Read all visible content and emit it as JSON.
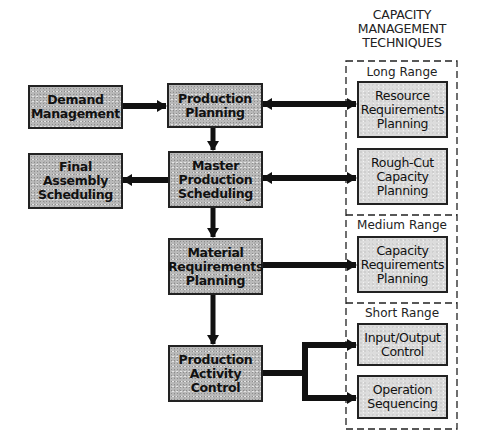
{
  "diagram": {
    "type": "flowchart",
    "header": {
      "title": "CAPACITY\nMANAGEMENT\nTECHNIQUES"
    },
    "planning_boxes": [
      {
        "id": "demand_management",
        "label": "Demand\nManagement"
      },
      {
        "id": "production_planning",
        "label": "Production\nPlanning"
      },
      {
        "id": "final_assembly_scheduling",
        "label": "Final\nAssembly\nScheduling"
      },
      {
        "id": "master_production_scheduling",
        "label": "Master\nProduction\nScheduling"
      },
      {
        "id": "material_requirements_planning",
        "label": "Material\nRequirements\nPlanning"
      },
      {
        "id": "production_activity_control",
        "label": "Production\nActivity\nControl"
      }
    ],
    "capacity_sections": [
      {
        "label": "Long Range",
        "boxes": [
          {
            "id": "resource_requirements_planning",
            "label": "Resource\nRequirements\nPlanning"
          },
          {
            "id": "rough_cut_capacity_planning",
            "label": "Rough-Cut\nCapacity\nPlanning"
          }
        ]
      },
      {
        "label": "Medium Range",
        "boxes": [
          {
            "id": "capacity_requirements_planning",
            "label": "Capacity\nRequirements\nPlanning"
          }
        ]
      },
      {
        "label": "Short Range",
        "boxes": [
          {
            "id": "input_output_control",
            "label": "Input/Output\nControl"
          },
          {
            "id": "operation_sequencing",
            "label": "Operation\nSequencing"
          }
        ]
      }
    ],
    "edges": [
      {
        "from": "demand_management",
        "to": "production_planning",
        "direction": "one-way"
      },
      {
        "from": "production_planning",
        "to": "master_production_scheduling",
        "direction": "one-way"
      },
      {
        "from": "production_planning",
        "to": "resource_requirements_planning",
        "direction": "two-way"
      },
      {
        "from": "master_production_scheduling",
        "to": "final_assembly_scheduling",
        "direction": "one-way"
      },
      {
        "from": "master_production_scheduling",
        "to": "rough_cut_capacity_planning",
        "direction": "two-way"
      },
      {
        "from": "master_production_scheduling",
        "to": "material_requirements_planning",
        "direction": "one-way"
      },
      {
        "from": "material_requirements_planning",
        "to": "capacity_requirements_planning",
        "direction": "one-way"
      },
      {
        "from": "material_requirements_planning",
        "to": "production_activity_control",
        "direction": "one-way"
      },
      {
        "from": "production_activity_control",
        "to": "input_output_control",
        "direction": "one-way"
      },
      {
        "from": "production_activity_control",
        "to": "operation_sequencing",
        "direction": "one-way"
      }
    ]
  },
  "colors": {
    "planning_box_fill": "#b9b9b9",
    "capacity_box_fill": "#dcdcdc",
    "stroke": "#111111"
  }
}
